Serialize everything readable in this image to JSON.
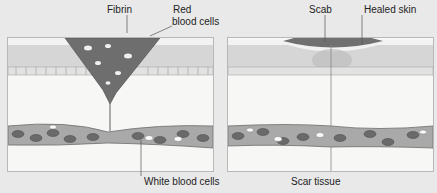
{
  "diagram": {
    "panels": [
      {
        "id": "wound-clotting",
        "labels": {
          "fibrin": "Fibrin",
          "red_blood_cells_1": "Red",
          "red_blood_cells_2": "blood cells",
          "white_blood_cells": "White blood cells"
        }
      },
      {
        "id": "wound-healed",
        "labels": {
          "scab": "Scab",
          "healed_skin": "Healed skin",
          "scar_tissue": "Scar tissue"
        }
      }
    ],
    "colors": {
      "background": "#e9e9e9",
      "skin_epidermis": "#d9d9d9",
      "clot": "#6e6e6e",
      "scab": "#707070",
      "vessel": "#a9a9a9",
      "cell": "#6a6a6a"
    }
  }
}
